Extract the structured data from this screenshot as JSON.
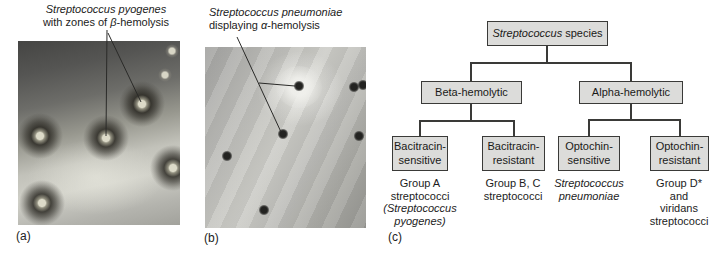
{
  "figure": {
    "panels": {
      "a": {
        "label": "(a)",
        "title_italic": "Streptococcus pyogenes",
        "title_pre": "with zones of ",
        "title_sym": "β",
        "title_post": "-hemolysis"
      },
      "b": {
        "label": "(b)",
        "title_italic": "Streptococcus pneumoniae",
        "title_pre": "displaying ",
        "title_sym": "α",
        "title_post": "-hemolysis"
      },
      "c": {
        "label": "(c)"
      }
    },
    "flowchart": {
      "root_italic": "Streptococcus",
      "root_rest": " species",
      "level2": [
        {
          "label": "Beta-hemolytic"
        },
        {
          "label": "Alpha-hemolytic"
        }
      ],
      "level3": [
        {
          "box": "Bacitracin-\nsensitive",
          "caption_lines": [
            "Group A",
            "streptococci",
            "(Streptococcus",
            "pyogenes)"
          ]
        },
        {
          "box": "Bacitracin-\nresistant",
          "caption_lines": [
            "Group B, C",
            "streptococci"
          ]
        },
        {
          "box": "Optochin-\nsensitive",
          "caption_lines": [
            "Streptococcus",
            "pneumoniae"
          ]
        },
        {
          "box": "Optochin-\nresistant",
          "caption_lines": [
            "Group D*",
            "and viridans",
            "streptococci"
          ]
        }
      ]
    },
    "colors": {
      "box_fill": "#dcdcda",
      "box_border": "#3a3a38",
      "connector": "#3a3a38"
    }
  }
}
